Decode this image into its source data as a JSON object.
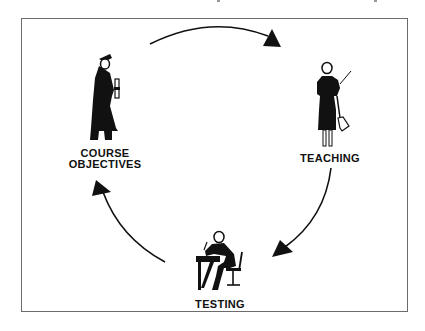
{
  "diagram": {
    "type": "cycle",
    "colors": {
      "ink": "#111111",
      "frame": "#6b6b6b",
      "background": "#ffffff"
    },
    "nodes": [
      {
        "id": "course-objectives",
        "label_lines": [
          "COURSE",
          "OBJECTIVES"
        ],
        "icon": "graduate-with-diploma-icon"
      },
      {
        "id": "teaching",
        "label_lines": [
          "TEACHING"
        ],
        "icon": "teacher-with-pointer-icon"
      },
      {
        "id": "testing",
        "label_lines": [
          "TESTING"
        ],
        "icon": "student-writing-at-desk-icon"
      }
    ],
    "edges": [
      {
        "from": "course-objectives",
        "to": "teaching"
      },
      {
        "from": "teaching",
        "to": "testing"
      },
      {
        "from": "testing",
        "to": "course-objectives"
      }
    ]
  }
}
